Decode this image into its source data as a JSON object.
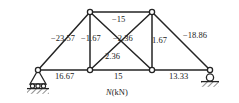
{
  "figure": {
    "caption": "N(kN)",
    "caption_symbol": "N",
    "caption_unit": "(kN)",
    "structure_type": "planar-truss",
    "line_color": "#242424",
    "node_fill": "#ffffff",
    "text_color": "#1b1b1b"
  },
  "nodes": [
    {
      "id": "A",
      "name": "left-support-node",
      "x": 38,
      "y": 70,
      "support": "pin"
    },
    {
      "id": "B",
      "name": "bottom-left-node",
      "x": 90,
      "y": 70,
      "support": "none"
    },
    {
      "id": "C",
      "name": "bottom-right-node",
      "x": 152,
      "y": 70,
      "support": "none"
    },
    {
      "id": "D",
      "name": "right-support-node",
      "x": 210,
      "y": 70,
      "support": "roller"
    },
    {
      "id": "E",
      "name": "top-left-node",
      "x": 90,
      "y": 12,
      "support": "none"
    },
    {
      "id": "F",
      "name": "top-right-node",
      "x": 152,
      "y": 12,
      "support": "none"
    }
  ],
  "members": [
    {
      "name": "member-top-chord",
      "from": "E",
      "to": "F",
      "force": "−15",
      "sign": "compression"
    },
    {
      "name": "member-left-diagonal",
      "from": "A",
      "to": "E",
      "force": "−23.57",
      "sign": "compression"
    },
    {
      "name": "member-right-diagonal",
      "from": "F",
      "to": "D",
      "force": "−18.86",
      "sign": "compression"
    },
    {
      "name": "member-left-vertical",
      "from": "B",
      "to": "E",
      "force": "−1.67",
      "sign": "compression"
    },
    {
      "name": "member-right-vertical",
      "from": "C",
      "to": "F",
      "force": "1.67",
      "sign": "tension"
    },
    {
      "name": "member-diagonal-ef-down",
      "from": "E",
      "to": "C",
      "force": "−2.36",
      "sign": "compression"
    },
    {
      "name": "member-diagonal-bf-up",
      "from": "B",
      "to": "F",
      "force": "2.36",
      "sign": "tension"
    },
    {
      "name": "member-bottom-left",
      "from": "A",
      "to": "B",
      "force": "16.67",
      "sign": "tension"
    },
    {
      "name": "member-bottom-middle",
      "from": "B",
      "to": "C",
      "force": "15",
      "sign": "tension"
    },
    {
      "name": "member-bottom-right",
      "from": "C",
      "to": "D",
      "force": "13.33",
      "sign": "tension"
    }
  ],
  "labels": [
    {
      "key": "top_chord",
      "text": "−15",
      "x": 115,
      "y": 19
    },
    {
      "key": "left_diagonal",
      "text": "−23.57",
      "x": 53,
      "y": 37
    },
    {
      "key": "left_vertical",
      "text": "−1.67",
      "x": 81,
      "y": 37
    },
    {
      "key": "diag_down",
      "text": "−2.36",
      "x": 116,
      "y": 37
    },
    {
      "key": "right_vertical",
      "text": "1.67",
      "x": 154,
      "y": 37
    },
    {
      "key": "right_diagonal",
      "text": "−18.86",
      "x": 185,
      "y": 34
    },
    {
      "key": "diag_up",
      "text": "2.36",
      "x": 108,
      "y": 55
    },
    {
      "key": "bottom_left",
      "text": "16.67",
      "x": 57,
      "y": 73
    },
    {
      "key": "bottom_middle",
      "text": "15",
      "x": 116,
      "y": 73
    },
    {
      "key": "bottom_right",
      "text": "13.33",
      "x": 172,
      "y": 73
    }
  ]
}
